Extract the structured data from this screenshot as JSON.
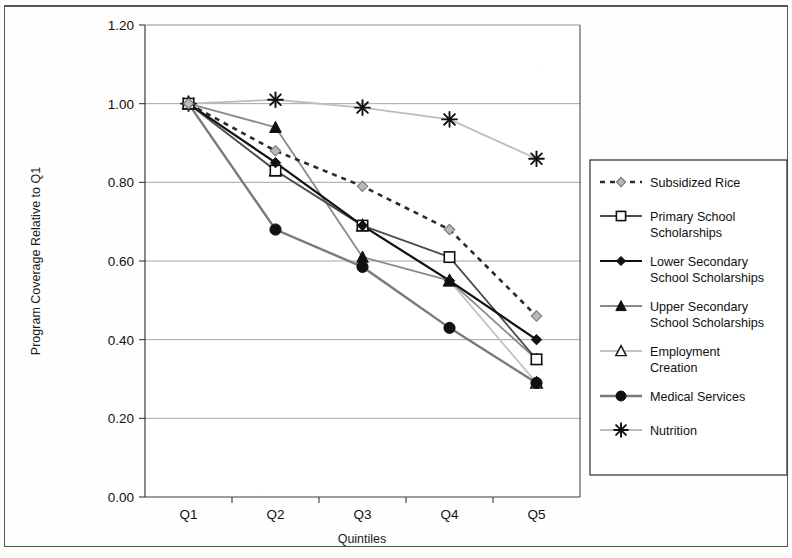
{
  "figure": {
    "background_color": "#ffffff",
    "has_outer_border": true
  },
  "chart_data": {
    "type": "line",
    "title": "",
    "xlabel": "Quintiles",
    "ylabel": "Program Coverage Relative to Q1",
    "categories": [
      "Q1",
      "Q2",
      "Q3",
      "Q4",
      "Q5"
    ],
    "ylim": [
      0.0,
      1.2
    ],
    "ytick_step": 0.2,
    "yticks": [
      "0.00",
      "0.20",
      "0.40",
      "0.60",
      "0.80",
      "1.00",
      "1.20"
    ],
    "ytick_values": [
      0.0,
      0.2,
      0.4,
      0.6,
      0.8,
      1.0,
      1.2
    ],
    "grid": "horizontal",
    "legend_position": "right",
    "series": [
      {
        "name": "Subsidized Rice",
        "values": [
          1.0,
          0.88,
          0.79,
          0.68,
          0.46
        ],
        "color": "#6f6f6f",
        "line_style": "dashed",
        "marker": "diamond-open"
      },
      {
        "name": "Primary School Scholarships",
        "values": [
          1.0,
          0.83,
          0.69,
          0.61,
          0.35
        ],
        "color": "#4d4d4d",
        "line_style": "solid",
        "marker": "square-open"
      },
      {
        "name": "Lower Secondary School Scholarships",
        "values": [
          1.0,
          0.85,
          0.69,
          0.55,
          0.4
        ],
        "color": "#111111",
        "line_style": "solid",
        "marker": "diamond-filled"
      },
      {
        "name": "Upper Secondary School Scholarships",
        "values": [
          1.0,
          0.94,
          0.61,
          0.55,
          0.35
        ],
        "color": "#8a8a8a",
        "line_style": "solid",
        "marker": "triangle-filled"
      },
      {
        "name": "Employment Creation",
        "values": [
          1.0,
          0.83,
          0.69,
          0.55,
          0.29
        ],
        "color": "#c2c2c2",
        "line_style": "solid",
        "marker": "triangle-open"
      },
      {
        "name": "Medical Services",
        "values": [
          1.0,
          0.68,
          0.585,
          0.43,
          0.29
        ],
        "color": "#7a7a7a",
        "line_style": "solid",
        "marker": "circle-filled"
      },
      {
        "name": "Nutrition",
        "values": [
          1.0,
          1.01,
          0.99,
          0.96,
          0.86
        ],
        "color": "#bdbdbd",
        "line_style": "solid",
        "marker": "star-x"
      }
    ]
  },
  "legend": {
    "entries": [
      "Subsidized Rice",
      "Primary School Scholarships",
      "Lower Secondary School Scholarships",
      "Upper Secondary School Scholarships",
      "Employment Creation",
      "Medical Services",
      "Nutrition"
    ]
  }
}
